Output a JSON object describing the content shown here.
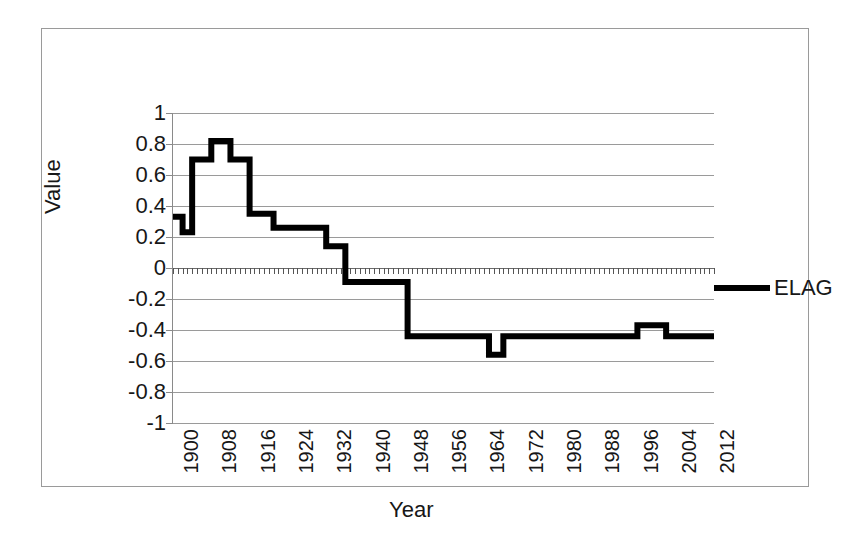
{
  "chart_data": {
    "type": "line",
    "title": "",
    "xlabel": "Year",
    "ylabel": "Value",
    "xlim": [
      1900,
      2013
    ],
    "ylim": [
      -1,
      1
    ],
    "grid": true,
    "legend_position": "right",
    "y_ticks": [
      "1",
      "0.8",
      "0.6",
      "0.4",
      "0.2",
      "0",
      "-0.2",
      "-0.4",
      "-0.6",
      "-0.8",
      "-1"
    ],
    "y_tick_values": [
      1,
      0.8,
      0.6,
      0.4,
      0.2,
      0,
      -0.2,
      -0.4,
      -0.6,
      -0.8,
      -1
    ],
    "x_ticks": [
      "1900",
      "1908",
      "1916",
      "1924",
      "1932",
      "1940",
      "1948",
      "1956",
      "1964",
      "1972",
      "1980",
      "1988",
      "1996",
      "2004",
      "2012"
    ],
    "x_tick_values": [
      1900,
      1908,
      1916,
      1924,
      1932,
      1940,
      1948,
      1956,
      1964,
      1972,
      1980,
      1988,
      1996,
      2004,
      2012
    ],
    "series": [
      {
        "name": "ELAG",
        "color": "#000000",
        "x": [
          1900,
          1901,
          1902,
          1903,
          1904,
          1905,
          1906,
          1907,
          1908,
          1909,
          1910,
          1911,
          1912,
          1913,
          1914,
          1915,
          1916,
          1917,
          1918,
          1919,
          1920,
          1921,
          1922,
          1923,
          1924,
          1925,
          1926,
          1927,
          1928,
          1929,
          1930,
          1931,
          1932,
          1933,
          1934,
          1935,
          1936,
          1937,
          1938,
          1939,
          1940,
          1941,
          1942,
          1943,
          1944,
          1945,
          1946,
          1947,
          1948,
          1949,
          1950,
          1951,
          1952,
          1953,
          1954,
          1955,
          1956,
          1957,
          1958,
          1959,
          1960,
          1961,
          1962,
          1963,
          1964,
          1965,
          1966,
          1967,
          1968,
          1969,
          1970,
          1971,
          1972,
          1973,
          1974,
          1975,
          1976,
          1977,
          1978,
          1979,
          1980,
          1981,
          1982,
          1983,
          1984,
          1985,
          1986,
          1987,
          1988,
          1989,
          1990,
          1991,
          1992,
          1993,
          1994,
          1995,
          1996,
          1997,
          1998,
          1999,
          2000,
          2001,
          2002,
          2003,
          2004,
          2005,
          2006,
          2007,
          2008,
          2009,
          2010,
          2011,
          2012,
          2013
        ],
        "y": [
          0.33,
          0.33,
          0.23,
          0.23,
          0.7,
          0.7,
          0.7,
          0.7,
          0.82,
          0.82,
          0.82,
          0.82,
          0.7,
          0.7,
          0.7,
          0.7,
          0.35,
          0.35,
          0.35,
          0.35,
          0.35,
          0.26,
          0.26,
          0.26,
          0.26,
          0.26,
          0.26,
          0.26,
          0.26,
          0.26,
          0.26,
          0.26,
          0.14,
          0.14,
          0.14,
          0.14,
          -0.09,
          -0.09,
          -0.09,
          -0.09,
          -0.09,
          -0.09,
          -0.09,
          -0.09,
          -0.09,
          -0.09,
          -0.09,
          -0.09,
          -0.09,
          -0.44,
          -0.44,
          -0.44,
          -0.44,
          -0.44,
          -0.44,
          -0.44,
          -0.44,
          -0.44,
          -0.44,
          -0.44,
          -0.44,
          -0.44,
          -0.44,
          -0.44,
          -0.44,
          -0.44,
          -0.56,
          -0.56,
          -0.56,
          -0.44,
          -0.44,
          -0.44,
          -0.44,
          -0.44,
          -0.44,
          -0.44,
          -0.44,
          -0.44,
          -0.44,
          -0.44,
          -0.44,
          -0.44,
          -0.44,
          -0.44,
          -0.44,
          -0.44,
          -0.44,
          -0.44,
          -0.44,
          -0.44,
          -0.44,
          -0.44,
          -0.44,
          -0.44,
          -0.44,
          -0.44,
          -0.44,
          -0.37,
          -0.37,
          -0.37,
          -0.37,
          -0.37,
          -0.37,
          -0.44,
          -0.44,
          -0.44,
          -0.44,
          -0.44,
          -0.44,
          -0.44,
          -0.44,
          -0.44,
          -0.44,
          -0.44
        ]
      }
    ]
  },
  "legend": {
    "label": "ELAG"
  },
  "axes": {
    "y_title": "Value",
    "x_title": "Year"
  }
}
